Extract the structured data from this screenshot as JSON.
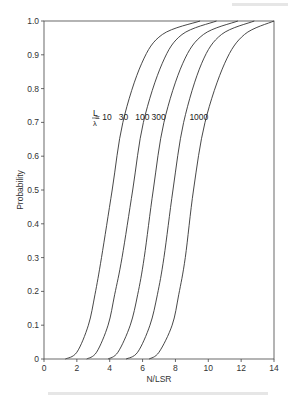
{
  "chart_data": {
    "type": "line",
    "title": "",
    "xlabel": "N/LSR",
    "ylabel": "Probability",
    "xlim": [
      0,
      14
    ],
    "ylim": [
      0,
      1.0
    ],
    "grid": false,
    "x_ticks": [
      0,
      2,
      4,
      6,
      8,
      10,
      12,
      14
    ],
    "y_ticks": [
      0,
      0.1,
      0.2,
      0.3,
      0.4,
      0.5,
      0.6,
      0.7,
      0.8,
      0.9,
      1.0
    ],
    "y_tick_labels": [
      "0",
      "0.1",
      "0.2",
      "0.3",
      "0.4",
      "0.5",
      "0.6",
      "0.7",
      "0.8",
      "0.9",
      "1.0"
    ],
    "legend": {
      "position": "inline",
      "prefix": "L/λ",
      "entries": [
        "10",
        "30",
        "100",
        "300",
        "1000"
      ]
    },
    "series": [
      {
        "name": "L/λ = 10",
        "x": [
          1.3,
          2.0,
          2.7,
          3.1,
          3.5,
          4.15,
          4.8,
          5.95,
          7.2,
          9.5
        ],
        "y": [
          0,
          0.02,
          0.1,
          0.19,
          0.3,
          0.5,
          0.7,
          0.875,
          0.96,
          1.0
        ]
      },
      {
        "name": "L/λ = 30",
        "x": [
          2.6,
          3.2,
          3.9,
          4.3,
          4.75,
          5.4,
          6.05,
          7.2,
          8.4,
          10.5
        ],
        "y": [
          0,
          0.02,
          0.1,
          0.19,
          0.3,
          0.5,
          0.7,
          0.875,
          0.96,
          1.0
        ]
      },
      {
        "name": "L/λ = 100",
        "x": [
          3.9,
          4.5,
          5.25,
          5.7,
          6.1,
          6.65,
          7.3,
          8.45,
          9.7,
          11.8
        ],
        "y": [
          0,
          0.02,
          0.1,
          0.19,
          0.3,
          0.5,
          0.7,
          0.875,
          0.96,
          1.0
        ]
      },
      {
        "name": "L/λ = 300",
        "x": [
          5.0,
          5.7,
          6.45,
          6.9,
          7.3,
          7.85,
          8.5,
          9.6,
          10.8,
          12.8
        ],
        "y": [
          0,
          0.02,
          0.1,
          0.19,
          0.3,
          0.5,
          0.7,
          0.875,
          0.96,
          1.0
        ]
      },
      {
        "name": "L/λ = 1000",
        "x": [
          6.4,
          7.0,
          7.8,
          8.2,
          8.6,
          9.1,
          9.8,
          11.0,
          12.2,
          14.0
        ],
        "y": [
          0,
          0.02,
          0.1,
          0.19,
          0.3,
          0.5,
          0.7,
          0.875,
          0.96,
          1.0
        ]
      }
    ],
    "annotations": [
      {
        "text": "= 10",
        "x": 3.1,
        "y": 0.715
      },
      {
        "text": "30",
        "x": 4.55,
        "y": 0.715
      },
      {
        "text": "100",
        "x": 5.55,
        "y": 0.715
      },
      {
        "text": "300",
        "x": 6.55,
        "y": 0.715
      },
      {
        "text": "1000",
        "x": 8.85,
        "y": 0.715
      }
    ],
    "colors": {
      "line": "#333333",
      "axis": "#444444",
      "text": "#333333"
    }
  },
  "labels": {
    "xlabel": "N/LSR",
    "ylabel": "Probability",
    "legend_L": "L",
    "legend_lambda": "λ"
  }
}
